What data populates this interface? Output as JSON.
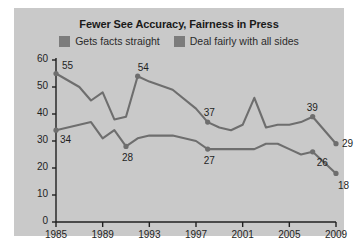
{
  "chart_data": {
    "type": "line",
    "title": "Fewer See Accuracy, Fairness in Press",
    "xlabel": "",
    "ylabel": "",
    "xlim": [
      1985,
      2009
    ],
    "ylim": [
      0,
      60
    ],
    "yticks": [
      0,
      10,
      20,
      30,
      40,
      50,
      60
    ],
    "xticks": [
      1985,
      1989,
      1993,
      1997,
      2001,
      2005,
      2009
    ],
    "grid": false,
    "legend_position": "top-center",
    "series": [
      {
        "name": "Gets facts straight",
        "color": "#6e6e6e",
        "x": [
          1985,
          1987,
          1988,
          1989,
          1990,
          1991,
          1992,
          1993,
          1995,
          1997,
          1998,
          1999,
          2000,
          2001,
          2002,
          2003,
          2004,
          2005,
          2006,
          2007,
          2009
        ],
        "values": [
          55,
          50,
          45,
          48,
          38,
          39,
          54,
          52,
          49,
          42,
          37,
          35,
          34,
          36,
          46,
          35,
          36,
          36,
          37,
          39,
          29
        ],
        "labeled_points": [
          {
            "x": 1985,
            "y": 55,
            "label": "55"
          },
          {
            "x": 1992,
            "y": 54,
            "label": "54"
          },
          {
            "x": 1998,
            "y": 37,
            "label": "37"
          },
          {
            "x": 2007,
            "y": 39,
            "label": "39"
          },
          {
            "x": 2009,
            "y": 29,
            "label": "29"
          }
        ]
      },
      {
        "name": "Deal fairly with all sides",
        "color": "#6e6e6e",
        "x": [
          1985,
          1987,
          1988,
          1989,
          1990,
          1991,
          1992,
          1993,
          1995,
          1997,
          1998,
          1999,
          2000,
          2001,
          2002,
          2003,
          2004,
          2005,
          2006,
          2007,
          2009
        ],
        "values": [
          34,
          36,
          37,
          31,
          34,
          28,
          31,
          32,
          32,
          30,
          27,
          27,
          27,
          27,
          27,
          29,
          29,
          27,
          25,
          26,
          18
        ],
        "labeled_points": [
          {
            "x": 1985,
            "y": 34,
            "label": "34"
          },
          {
            "x": 1991,
            "y": 28,
            "label": "28"
          },
          {
            "x": 1998,
            "y": 27,
            "label": "27"
          },
          {
            "x": 2007,
            "y": 26,
            "label": "26"
          },
          {
            "x": 2009,
            "y": 18,
            "label": "18"
          }
        ]
      }
    ],
    "legend": [
      {
        "label": "Gets facts straight",
        "color": "#7c7c7c"
      },
      {
        "label": "Deal fairly with all sides",
        "color": "#7c7c7c"
      }
    ]
  }
}
